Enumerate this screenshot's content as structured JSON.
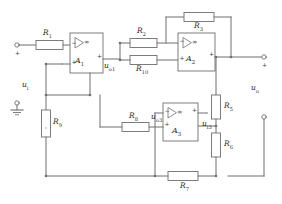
{
  "figure": {
    "kind": "circuit-schematic",
    "width": 282,
    "height": 204,
    "line_color": "#6f6f6f",
    "text_color": "#2b2b2b",
    "background": "#ffffff"
  },
  "opamps": [
    {
      "id": "A1",
      "name": "A",
      "sub": "1",
      "gain_symbol": "∞",
      "minus": "−",
      "plus": "+"
    },
    {
      "id": "A2",
      "name": "A",
      "sub": "2",
      "gain_symbol": "∞",
      "minus": "−",
      "plus": "+"
    },
    {
      "id": "A3",
      "name": "A",
      "sub": "3",
      "gain_symbol": "∞",
      "minus": "−",
      "plus": "+"
    }
  ],
  "resistors": [
    {
      "id": "R1",
      "name": "R",
      "sub": "1"
    },
    {
      "id": "R2",
      "name": "R",
      "sub": "2"
    },
    {
      "id": "R3",
      "name": "R",
      "sub": "3"
    },
    {
      "id": "R5",
      "name": "R",
      "sub": "5"
    },
    {
      "id": "R6",
      "name": "R",
      "sub": "6"
    },
    {
      "id": "R7",
      "name": "R",
      "sub": "7"
    },
    {
      "id": "R8",
      "name": "R",
      "sub": "8"
    },
    {
      "id": "R9",
      "name": "R",
      "sub": "9"
    },
    {
      "id": "R10",
      "name": "R",
      "sub": "10"
    }
  ],
  "nodes": {
    "u_i": {
      "name": "u",
      "sub": "i"
    },
    "u_o1": {
      "name": "u",
      "sub": "o1"
    },
    "u_o3": {
      "name": "u",
      "sub": "o3"
    },
    "u_i3": {
      "name": "u",
      "sub": "i3"
    },
    "u_o": {
      "name": "u",
      "sub": "o"
    }
  },
  "terminals": [
    {
      "id": "in-pos",
      "polarity": "+"
    },
    {
      "id": "in-gnd",
      "polarity": ""
    },
    {
      "id": "out-pos",
      "polarity": "+"
    },
    {
      "id": "out-neg",
      "polarity": ""
    }
  ],
  "symbols": {
    "ground": "ground-symbol",
    "infinity": "∞"
  }
}
